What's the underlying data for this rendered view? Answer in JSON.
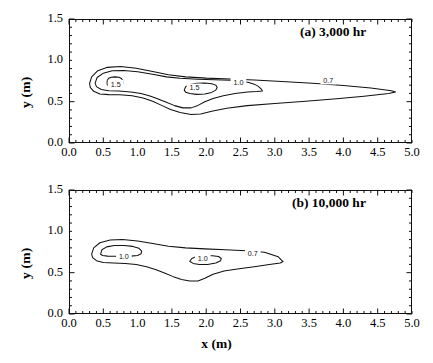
{
  "figure": {
    "xlabel": "x (m)",
    "ylabel": "y (m)",
    "xticks": [
      "0.0",
      "0.5",
      "1.0",
      "1.5",
      "2.0",
      "2.5",
      "3.0",
      "3.5",
      "4.0",
      "4.5",
      "5.0"
    ],
    "yticks": [
      "0.0",
      "0.5",
      "1.0",
      "1.5"
    ],
    "line_color": "#111111",
    "background": "#ffffff"
  },
  "chart_data": [
    {
      "type": "line",
      "title": "(a) 3,000 hr",
      "xlabel": "x (m)",
      "ylabel": "y (m)",
      "xlim": [
        0.0,
        5.0
      ],
      "ylim": [
        0.0,
        1.5
      ],
      "xticks": [
        0.0,
        0.5,
        1.0,
        1.5,
        2.0,
        2.5,
        3.0,
        3.5,
        4.0,
        4.5,
        5.0
      ],
      "yticks": [
        0.0,
        0.5,
        1.0,
        1.5
      ],
      "minor_tick_interval": 0.1,
      "grid": false,
      "legend": "none",
      "plot_kind": "contour",
      "contour_levels": [
        0.7,
        1.0,
        1.5
      ],
      "contour_labels": [
        {
          "text": "1.5",
          "x": 0.68,
          "y": 0.71
        },
        {
          "text": "1.5",
          "x": 1.83,
          "y": 0.665
        },
        {
          "text": "1.0",
          "x": 2.47,
          "y": 0.735
        },
        {
          "text": "0.7",
          "x": 3.78,
          "y": 0.755
        }
      ],
      "contours": [
        {
          "level": 0.7,
          "closed": true,
          "points": [
            [
              0.3,
              0.72
            ],
            [
              0.33,
              0.8
            ],
            [
              0.42,
              0.875
            ],
            [
              0.56,
              0.915
            ],
            [
              0.75,
              0.925
            ],
            [
              0.98,
              0.905
            ],
            [
              1.22,
              0.865
            ],
            [
              1.45,
              0.825
            ],
            [
              1.7,
              0.8
            ],
            [
              2.0,
              0.785
            ],
            [
              2.35,
              0.775
            ],
            [
              2.7,
              0.762
            ],
            [
              3.1,
              0.745
            ],
            [
              3.55,
              0.722
            ],
            [
              4.0,
              0.695
            ],
            [
              4.4,
              0.665
            ],
            [
              4.7,
              0.632
            ],
            [
              4.76,
              0.618
            ],
            [
              4.66,
              0.6
            ],
            [
              4.3,
              0.566
            ],
            [
              3.9,
              0.535
            ],
            [
              3.45,
              0.505
            ],
            [
              3.0,
              0.478
            ],
            [
              2.6,
              0.452
            ],
            [
              2.3,
              0.42
            ],
            [
              2.08,
              0.385
            ],
            [
              1.92,
              0.352
            ],
            [
              1.78,
              0.345
            ],
            [
              1.62,
              0.368
            ],
            [
              1.48,
              0.405
            ],
            [
              1.35,
              0.455
            ],
            [
              1.22,
              0.505
            ],
            [
              1.08,
              0.545
            ],
            [
              0.92,
              0.572
            ],
            [
              0.74,
              0.583
            ],
            [
              0.58,
              0.585
            ],
            [
              0.45,
              0.592
            ],
            [
              0.36,
              0.625
            ],
            [
              0.31,
              0.672
            ],
            [
              0.3,
              0.72
            ]
          ]
        },
        {
          "level": 1.0,
          "closed": true,
          "points": [
            [
              0.38,
              0.725
            ],
            [
              0.41,
              0.792
            ],
            [
              0.5,
              0.845
            ],
            [
              0.63,
              0.875
            ],
            [
              0.8,
              0.878
            ],
            [
              1.0,
              0.862
            ],
            [
              1.22,
              0.832
            ],
            [
              1.42,
              0.8
            ],
            [
              1.62,
              0.783
            ],
            [
              1.88,
              0.772
            ],
            [
              2.12,
              0.765
            ],
            [
              2.35,
              0.758
            ],
            [
              2.52,
              0.748
            ],
            [
              2.62,
              0.733
            ],
            [
              2.7,
              0.712
            ],
            [
              2.76,
              0.685
            ],
            [
              2.8,
              0.655
            ],
            [
              2.82,
              0.628
            ],
            [
              2.74,
              0.622
            ],
            [
              2.6,
              0.618
            ],
            [
              2.42,
              0.6
            ],
            [
              2.25,
              0.572
            ],
            [
              2.1,
              0.538
            ],
            [
              1.98,
              0.498
            ],
            [
              1.88,
              0.455
            ],
            [
              1.78,
              0.425
            ],
            [
              1.66,
              0.425
            ],
            [
              1.54,
              0.452
            ],
            [
              1.42,
              0.492
            ],
            [
              1.3,
              0.532
            ],
            [
              1.18,
              0.568
            ],
            [
              1.05,
              0.598
            ],
            [
              0.9,
              0.618
            ],
            [
              0.73,
              0.628
            ],
            [
              0.58,
              0.632
            ],
            [
              0.47,
              0.648
            ],
            [
              0.4,
              0.682
            ],
            [
              0.38,
              0.725
            ]
          ]
        },
        {
          "level": 1.5,
          "closed": true,
          "name": "peak-1",
          "points": [
            [
              0.555,
              0.715
            ],
            [
              0.558,
              0.755
            ],
            [
              0.578,
              0.782
            ],
            [
              0.615,
              0.795
            ],
            [
              0.672,
              0.8
            ],
            [
              0.728,
              0.795
            ],
            [
              0.765,
              0.78
            ],
            [
              0.782,
              0.755
            ],
            [
              0.785,
              0.722
            ],
            [
              0.778,
              0.7
            ],
            [
              0.752,
              0.692
            ],
            [
              0.715,
              0.692
            ],
            [
              0.7,
              0.705
            ],
            [
              0.69,
              0.7
            ],
            [
              0.672,
              0.69
            ],
            [
              0.63,
              0.688
            ],
            [
              0.588,
              0.692
            ],
            [
              0.562,
              0.7
            ],
            [
              0.555,
              0.715
            ]
          ]
        },
        {
          "level": 1.5,
          "closed": true,
          "name": "peak-2",
          "points": [
            [
              1.68,
              0.64
            ],
            [
              1.7,
              0.68
            ],
            [
              1.76,
              0.708
            ],
            [
              1.86,
              0.722
            ],
            [
              1.98,
              0.725
            ],
            [
              2.08,
              0.718
            ],
            [
              2.14,
              0.7
            ],
            [
              2.16,
              0.672
            ],
            [
              2.14,
              0.64
            ],
            [
              2.08,
              0.612
            ],
            [
              1.98,
              0.592
            ],
            [
              1.86,
              0.588
            ],
            [
              1.76,
              0.598
            ],
            [
              1.7,
              0.615
            ],
            [
              1.68,
              0.64
            ]
          ]
        }
      ]
    },
    {
      "type": "line",
      "title": "(b) 10,000 hr",
      "xlabel": "x (m)",
      "ylabel": "y (m)",
      "xlim": [
        0.0,
        5.0
      ],
      "ylim": [
        0.0,
        1.5
      ],
      "xticks": [
        0.0,
        0.5,
        1.0,
        1.5,
        2.0,
        2.5,
        3.0,
        3.5,
        4.0,
        4.5,
        5.0
      ],
      "yticks": [
        0.0,
        0.5,
        1.0,
        1.5
      ],
      "minor_tick_interval": 0.1,
      "grid": false,
      "legend": "none",
      "plot_kind": "contour",
      "contour_levels": [
        0.7,
        1.0
      ],
      "contour_labels": [
        {
          "text": "1.0",
          "x": 0.8,
          "y": 0.695
        },
        {
          "text": "1.0",
          "x": 1.95,
          "y": 0.665
        },
        {
          "text": "0.7",
          "x": 2.68,
          "y": 0.735
        }
      ],
      "contours": [
        {
          "level": 0.7,
          "closed": true,
          "points": [
            [
              0.33,
              0.725
            ],
            [
              0.36,
              0.8
            ],
            [
              0.45,
              0.862
            ],
            [
              0.6,
              0.895
            ],
            [
              0.78,
              0.9
            ],
            [
              1.0,
              0.882
            ],
            [
              1.22,
              0.852
            ],
            [
              1.45,
              0.82
            ],
            [
              1.7,
              0.8
            ],
            [
              1.98,
              0.788
            ],
            [
              2.28,
              0.778
            ],
            [
              2.58,
              0.765
            ],
            [
              2.85,
              0.748
            ],
            [
              3.05,
              0.692
            ],
            [
              3.12,
              0.635
            ],
            [
              3.08,
              0.618
            ],
            [
              2.92,
              0.598
            ],
            [
              2.7,
              0.572
            ],
            [
              2.48,
              0.548
            ],
            [
              2.26,
              0.52
            ],
            [
              2.1,
              0.48
            ],
            [
              1.98,
              0.432
            ],
            [
              1.88,
              0.4
            ],
            [
              1.76,
              0.398
            ],
            [
              1.64,
              0.418
            ],
            [
              1.52,
              0.452
            ],
            [
              1.4,
              0.492
            ],
            [
              1.27,
              0.535
            ],
            [
              1.13,
              0.572
            ],
            [
              0.98,
              0.598
            ],
            [
              0.82,
              0.612
            ],
            [
              0.65,
              0.618
            ],
            [
              0.5,
              0.622
            ],
            [
              0.4,
              0.645
            ],
            [
              0.345,
              0.682
            ],
            [
              0.33,
              0.725
            ]
          ]
        },
        {
          "level": 1.0,
          "closed": true,
          "name": "peak-1",
          "points": [
            [
              0.46,
              0.722
            ],
            [
              0.48,
              0.778
            ],
            [
              0.55,
              0.812
            ],
            [
              0.66,
              0.828
            ],
            [
              0.8,
              0.828
            ],
            [
              0.93,
              0.818
            ],
            [
              1.02,
              0.795
            ],
            [
              1.06,
              0.762
            ],
            [
              1.05,
              0.728
            ],
            [
              1.0,
              0.708
            ],
            [
              0.9,
              0.7
            ],
            [
              0.78,
              0.698
            ],
            [
              0.66,
              0.698
            ],
            [
              0.56,
              0.7
            ],
            [
              0.49,
              0.708
            ],
            [
              0.46,
              0.722
            ]
          ]
        },
        {
          "level": 1.0,
          "closed": true,
          "name": "peak-2",
          "points": [
            [
              1.76,
              0.638
            ],
            [
              1.79,
              0.672
            ],
            [
              1.86,
              0.695
            ],
            [
              1.97,
              0.705
            ],
            [
              2.09,
              0.705
            ],
            [
              2.18,
              0.695
            ],
            [
              2.22,
              0.672
            ],
            [
              2.21,
              0.645
            ],
            [
              2.14,
              0.618
            ],
            [
              2.02,
              0.6
            ],
            [
              1.9,
              0.598
            ],
            [
              1.81,
              0.612
            ],
            [
              1.76,
              0.638
            ]
          ]
        }
      ]
    }
  ]
}
